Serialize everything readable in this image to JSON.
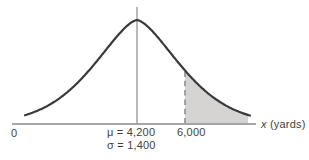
{
  "figure": {
    "origin_label": "0",
    "mean_label": "μ = 4,200",
    "sigma_label": "σ = 1,400",
    "cutoff_label": "6,000",
    "axis_label_var": "x",
    "axis_label_unit": " (yards)"
  },
  "colors": {
    "curve": "#3a3a3a",
    "axis": "#8a8a8a",
    "mean_line": "#8a8a8a",
    "dashed_line": "#9a9a9a",
    "shade": "#d5d4d2",
    "text": "#3f3f3f",
    "background": "#ffffff"
  },
  "chart_data": {
    "type": "area",
    "subtype": "normal-distribution-curve",
    "title": "",
    "xlabel": "x (yards)",
    "x_origin": 0,
    "mean": 4200,
    "std_dev": 1400,
    "shaded_region": {
      "from": 6000,
      "direction": "right-tail",
      "style": "filled"
    },
    "markers": [
      {
        "x": 4200,
        "label": "μ = 4,200",
        "line": "solid-vertical"
      },
      {
        "x": 6000,
        "label": "6,000",
        "line": "dashed-vertical"
      }
    ],
    "annotations": [
      "μ = 4,200",
      "σ = 1,400"
    ],
    "legend": false,
    "grid": false
  }
}
